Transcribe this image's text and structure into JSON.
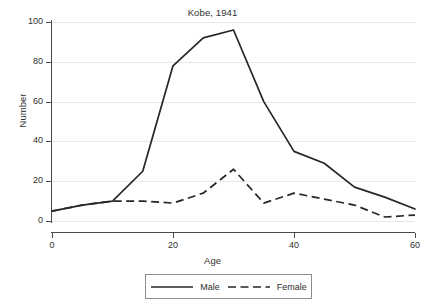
{
  "chart_data": {
    "type": "line",
    "title": "Kobe, 1941",
    "xlabel": "Age",
    "ylabel": "Number",
    "xlim": [
      0,
      60
    ],
    "ylim": [
      0,
      100
    ],
    "xticks": [
      "0",
      "20",
      "40",
      "60"
    ],
    "yticks": [
      "0",
      "20",
      "40",
      "60",
      "80",
      "100"
    ],
    "grid": "horizontal",
    "legend_position": "bottom",
    "x": [
      0,
      5,
      10,
      15,
      20,
      25,
      30,
      35,
      40,
      45,
      50,
      55,
      60
    ],
    "series": [
      {
        "name": "Male",
        "style": "solid",
        "color": "#272727",
        "values": [
          5,
          8,
          10,
          25,
          78,
          92,
          96,
          60,
          35,
          29,
          17,
          12,
          6
        ]
      },
      {
        "name": "Female",
        "style": "dashed",
        "color": "#272727",
        "values": [
          5,
          8,
          10,
          10,
          9,
          14,
          26,
          9,
          14,
          11,
          8,
          2,
          3
        ]
      }
    ]
  },
  "legend": {
    "items": [
      {
        "label": "Male"
      },
      {
        "label": "Female"
      }
    ]
  }
}
